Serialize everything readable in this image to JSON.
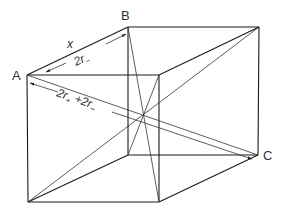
{
  "figure": {
    "type": "cube unit cell with face and body diagonals",
    "vertex_labels": {
      "a": "A",
      "b": "B",
      "c": "C"
    },
    "dimension_labels": {
      "edge": "x",
      "face_diagonal": {
        "main": "2r",
        "sub": "−"
      },
      "body_diagonal": {
        "part1": "2r",
        "sub1": "+",
        "plus": " +2r",
        "sub2": "−"
      }
    },
    "colors": {
      "line": "#1a1a1a",
      "text": "#333333",
      "background": "#ffffff"
    }
  }
}
